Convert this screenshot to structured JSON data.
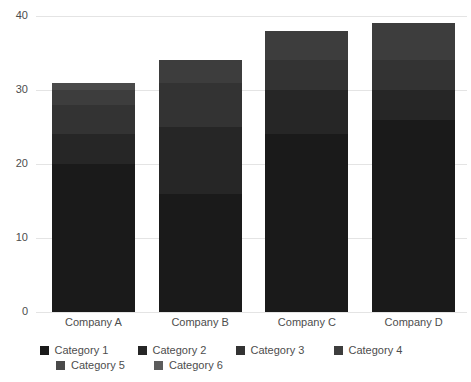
{
  "chart_data": {
    "type": "bar",
    "stacked": true,
    "title": "",
    "xlabel": "",
    "ylabel": "",
    "ylim": [
      0,
      40
    ],
    "yticks": [
      0,
      10,
      20,
      30,
      40
    ],
    "ytick_labels": [
      "0",
      "10",
      "20",
      "30",
      "40"
    ],
    "grid": true,
    "legend_position": "bottom",
    "categories": [
      "Company A",
      "Company B",
      "Company C",
      "Company D"
    ],
    "series": [
      {
        "name": "Category 1",
        "color": "#1a1a1a",
        "values": [
          20,
          16,
          24,
          26
        ]
      },
      {
        "name": "Category 2",
        "color": "#262626",
        "values": [
          4,
          9,
          6,
          4
        ]
      },
      {
        "name": "Category 3",
        "color": "#333333",
        "values": [
          4,
          6,
          4,
          4
        ]
      },
      {
        "name": "Category 4",
        "color": "#3d3d3d",
        "values": [
          2,
          3,
          4,
          5
        ]
      },
      {
        "name": "Category 5",
        "color": "#4a4a4a",
        "values": [
          1,
          0,
          0,
          0
        ]
      },
      {
        "name": "Category 6",
        "color": "#5c5c5c",
        "values": [
          0,
          0,
          0,
          0
        ]
      }
    ],
    "totals": [
      31,
      34,
      38,
      39
    ]
  },
  "axis": {
    "grid_color": "#e4e4e4",
    "tick_text_color": "#4d4d4d"
  }
}
